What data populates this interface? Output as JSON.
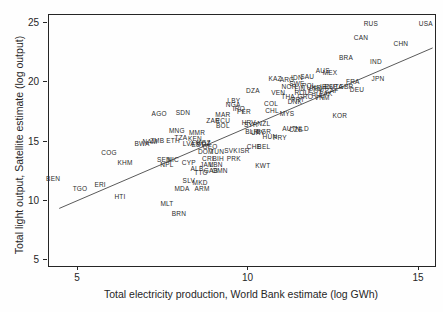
{
  "colors": {
    "frame": "#262626",
    "text": "#262626",
    "line": "#5a5a5a",
    "background": "#fefefe"
  },
  "chart_data": {
    "type": "scatter",
    "title": "",
    "xlabel": "Total electricity production, World Bank estimate (log GWh)",
    "ylabel": "Total light output, Satellite estimate (log output)",
    "xlim": [
      4.15,
      15.47
    ],
    "ylim": [
      4.49,
      25.68
    ],
    "xticks": [
      5,
      10,
      15
    ],
    "yticks": [
      5,
      10,
      15,
      20,
      25
    ],
    "grid": false,
    "legend": "none",
    "marker_style": "country-code-text",
    "fit_line": {
      "x1": 4.45,
      "y1": 9.35,
      "x2": 15.4,
      "y2": 22.9
    },
    "points": [
      {
        "label": "USA",
        "x": 15.2,
        "y": 24.92
      },
      {
        "label": "RUS",
        "x": 13.59,
        "y": 24.92
      },
      {
        "label": "CAN",
        "x": 13.3,
        "y": 23.73
      },
      {
        "label": "CHN",
        "x": 14.47,
        "y": 23.23
      },
      {
        "label": "BRA",
        "x": 12.86,
        "y": 22.05
      },
      {
        "label": "IND",
        "x": 13.74,
        "y": 21.71
      },
      {
        "label": "JPN",
        "x": 13.8,
        "y": 20.27
      },
      {
        "label": "FRA",
        "x": 13.06,
        "y": 20.02
      },
      {
        "label": "DEU",
        "x": 13.18,
        "y": 19.34
      },
      {
        "label": "GBR",
        "x": 12.86,
        "y": 19.6
      },
      {
        "label": "ITA",
        "x": 12.62,
        "y": 19.6
      },
      {
        "label": "ESP",
        "x": 12.42,
        "y": 19.6
      },
      {
        "label": "KOR",
        "x": 12.68,
        "y": 17.15
      },
      {
        "label": "AUS",
        "x": 12.18,
        "y": 20.95
      },
      {
        "label": "MEX",
        "x": 12.39,
        "y": 20.78
      },
      {
        "label": "SAU",
        "x": 11.72,
        "y": 20.44
      },
      {
        "label": "IDN",
        "x": 11.42,
        "y": 20.36
      },
      {
        "label": "ARG",
        "x": 11.13,
        "y": 20.19
      },
      {
        "label": "KAZ",
        "x": 10.78,
        "y": 20.27
      },
      {
        "label": "SWE",
        "x": 11.42,
        "y": 19.85
      },
      {
        "label": "NOR",
        "x": 11.19,
        "y": 19.6
      },
      {
        "label": "FIN",
        "x": 11.51,
        "y": 19.43
      },
      {
        "label": "POL",
        "x": 11.77,
        "y": 19.68
      },
      {
        "label": "UKR",
        "x": 11.92,
        "y": 19.51
      },
      {
        "label": "TUR",
        "x": 12.1,
        "y": 19.43
      },
      {
        "label": "IRN",
        "x": 12.27,
        "y": 19.6
      },
      {
        "label": "EGY",
        "x": 11.98,
        "y": 19.26
      },
      {
        "label": "ZAF",
        "x": 12.45,
        "y": 19.26
      },
      {
        "label": "PAK",
        "x": 12.27,
        "y": 19.0
      },
      {
        "label": "PHL",
        "x": 12.04,
        "y": 18.84
      },
      {
        "label": "VNM",
        "x": 12.16,
        "y": 18.67
      },
      {
        "label": "GRC",
        "x": 11.66,
        "y": 18.75
      },
      {
        "label": "PRT",
        "x": 11.45,
        "y": 18.5
      },
      {
        "label": "ROU",
        "x": 11.57,
        "y": 19.09
      },
      {
        "label": "DNK",
        "x": 11.36,
        "y": 18.33
      },
      {
        "label": "VEN",
        "x": 10.87,
        "y": 19.09
      },
      {
        "label": "THA",
        "x": 11.16,
        "y": 18.75
      },
      {
        "label": "DZA",
        "x": 10.13,
        "y": 19.26
      },
      {
        "label": "LBY",
        "x": 9.57,
        "y": 18.42
      },
      {
        "label": "NGA",
        "x": 9.55,
        "y": 18.08
      },
      {
        "label": "COL",
        "x": 10.66,
        "y": 18.16
      },
      {
        "label": "CHL",
        "x": 10.69,
        "y": 17.57
      },
      {
        "label": "MYS",
        "x": 11.13,
        "y": 17.32
      },
      {
        "label": "PER",
        "x": 9.87,
        "y": 17.49
      },
      {
        "label": "MAR",
        "x": 9.25,
        "y": 17.24
      },
      {
        "label": "IRQ",
        "x": 9.72,
        "y": 17.74
      },
      {
        "label": "ECU",
        "x": 9.25,
        "y": 16.73
      },
      {
        "label": "SYR",
        "x": 10.07,
        "y": 16.39
      },
      {
        "label": "NZL",
        "x": 10.45,
        "y": 16.48
      },
      {
        "label": "HRV",
        "x": 10.01,
        "y": 16.56
      },
      {
        "label": "BLR",
        "x": 10.1,
        "y": 15.8
      },
      {
        "label": "URY",
        "x": 10.28,
        "y": 15.72
      },
      {
        "label": "BGR",
        "x": 10.45,
        "y": 15.8
      },
      {
        "label": "AUT",
        "x": 11.19,
        "y": 16.05
      },
      {
        "label": "CZE",
        "x": 11.39,
        "y": 15.97
      },
      {
        "label": "NLD",
        "x": 11.57,
        "y": 16.05
      },
      {
        "label": "HUN",
        "x": 10.63,
        "y": 15.38
      },
      {
        "label": "PRY",
        "x": 10.92,
        "y": 15.3
      },
      {
        "label": "CHE",
        "x": 10.16,
        "y": 14.54
      },
      {
        "label": "BEL",
        "x": 10.45,
        "y": 14.54
      },
      {
        "label": "SVK",
        "x": 9.49,
        "y": 14.2
      },
      {
        "label": "ISR",
        "x": 9.87,
        "y": 14.2
      },
      {
        "label": "DOM",
        "x": 8.75,
        "y": 14.11
      },
      {
        "label": "TUN",
        "x": 9.08,
        "y": 14.11
      },
      {
        "label": "CRI",
        "x": 8.81,
        "y": 13.52
      },
      {
        "label": "BIH",
        "x": 9.11,
        "y": 13.52
      },
      {
        "label": "PRK",
        "x": 9.57,
        "y": 13.52
      },
      {
        "label": "KWT",
        "x": 10.42,
        "y": 12.93
      },
      {
        "label": "JAM",
        "x": 8.78,
        "y": 13.02
      },
      {
        "label": "LBN",
        "x": 9.05,
        "y": 13.02
      },
      {
        "label": "GAB",
        "x": 8.9,
        "y": 12.51
      },
      {
        "label": "OMN",
        "x": 9.16,
        "y": 12.51
      },
      {
        "label": "TTO",
        "x": 8.61,
        "y": 12.34
      },
      {
        "label": "ALB",
        "x": 8.49,
        "y": 12.68
      },
      {
        "label": "CYP",
        "x": 8.25,
        "y": 13.19
      },
      {
        "label": "NPL",
        "x": 7.61,
        "y": 13.02
      },
      {
        "label": "SEN",
        "x": 7.52,
        "y": 13.44
      },
      {
        "label": "NIC",
        "x": 7.79,
        "y": 13.44
      },
      {
        "label": "SLV",
        "x": 8.25,
        "y": 11.67
      },
      {
        "label": "MKD",
        "x": 8.58,
        "y": 11.5
      },
      {
        "label": "MDA",
        "x": 8.05,
        "y": 10.99
      },
      {
        "label": "ARM",
        "x": 8.64,
        "y": 10.99
      },
      {
        "label": "MLT",
        "x": 7.61,
        "y": 9.73
      },
      {
        "label": "BRN",
        "x": 7.96,
        "y": 8.88
      },
      {
        "label": "HTI",
        "x": 6.23,
        "y": 10.32
      },
      {
        "label": "ERI",
        "x": 5.65,
        "y": 11.33
      },
      {
        "label": "TGO",
        "x": 5.06,
        "y": 10.99
      },
      {
        "label": "BEN",
        "x": 4.27,
        "y": 11.84
      },
      {
        "label": "KHM",
        "x": 6.38,
        "y": 13.19
      },
      {
        "label": "COG",
        "x": 5.91,
        "y": 14.03
      },
      {
        "label": "BWA",
        "x": 6.88,
        "y": 14.79
      },
      {
        "label": "NAM",
        "x": 7.11,
        "y": 14.96
      },
      {
        "label": "ZMB",
        "x": 7.32,
        "y": 15.04
      },
      {
        "label": "ETH",
        "x": 7.79,
        "y": 15.04
      },
      {
        "label": "TZA",
        "x": 8.02,
        "y": 15.3
      },
      {
        "label": "AGO",
        "x": 7.38,
        "y": 17.32
      },
      {
        "label": "SDN",
        "x": 8.08,
        "y": 17.4
      },
      {
        "label": "ZAR",
        "x": 8.96,
        "y": 16.73
      },
      {
        "label": "BOL",
        "x": 9.25,
        "y": 16.3
      },
      {
        "label": "MNG",
        "x": 7.9,
        "y": 15.89
      },
      {
        "label": "MMR",
        "x": 8.49,
        "y": 15.72
      },
      {
        "label": "LVA",
        "x": 8.25,
        "y": 14.79
      },
      {
        "label": "EST",
        "x": 8.52,
        "y": 14.7
      },
      {
        "label": "KEN",
        "x": 8.43,
        "y": 15.21
      },
      {
        "label": "KGZ",
        "x": 8.69,
        "y": 14.87
      },
      {
        "label": "GEO",
        "x": 8.87,
        "y": 14.54
      },
      {
        "label": "MOZ",
        "x": 8.67,
        "y": 14.79
      }
    ]
  }
}
